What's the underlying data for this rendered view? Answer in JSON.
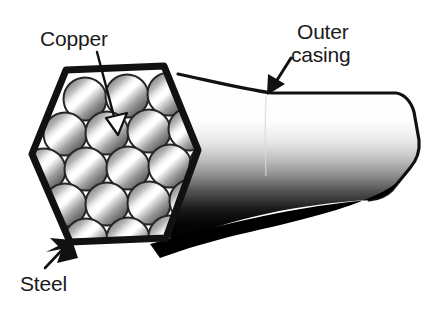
{
  "figure": {
    "kind": "technical-illustration",
    "background_color": "#ffffff"
  },
  "labels": {
    "copper": "Copper",
    "outer_casing_line1": "Outer",
    "outer_casing_line2": "casing",
    "steel": "Steel"
  },
  "colors": {
    "outline": "#111111",
    "casing_dark": "#000000",
    "casing_light": "#ffffff",
    "strand_mid": "#9a9a9a",
    "strand_dark": "#3a3a3a",
    "strand_highlight": "#ffffff",
    "text": "#1a1a1a"
  },
  "structure": {
    "cross_section_shape": "hexagon",
    "strand_count": 19,
    "strand_rows": [
      3,
      4,
      5,
      4,
      3
    ]
  }
}
